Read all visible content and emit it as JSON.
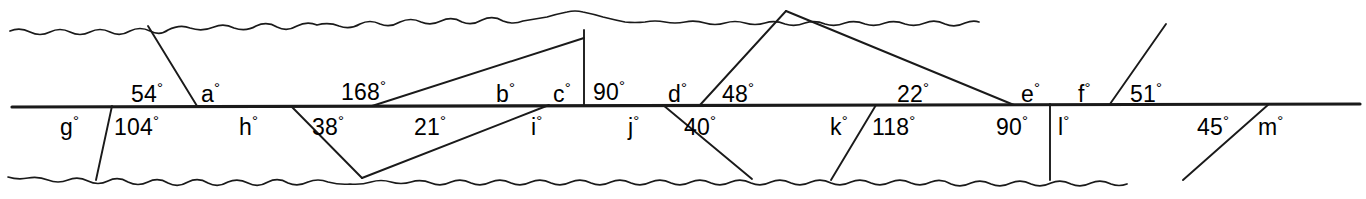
{
  "figure": {
    "type": "geometry-diagram",
    "line_color": "#1a1a1a",
    "background_color": "#ffffff"
  },
  "labels_above_line": [
    {
      "id": "a1",
      "text": "54",
      "x": 131,
      "y": 80
    },
    {
      "id": "a2",
      "text": "a",
      "x": 201,
      "y": 80
    },
    {
      "id": "a3",
      "text": "168",
      "x": 341,
      "y": 78
    },
    {
      "id": "a4",
      "text": "b",
      "x": 496,
      "y": 80
    },
    {
      "id": "a5",
      "text": "c",
      "x": 553,
      "y": 80
    },
    {
      "id": "a6",
      "text": "90",
      "x": 593,
      "y": 78
    },
    {
      "id": "a7",
      "text": "d",
      "x": 668,
      "y": 80
    },
    {
      "id": "a8",
      "text": "48",
      "x": 722,
      "y": 80
    },
    {
      "id": "a9",
      "text": "22",
      "x": 897,
      "y": 80
    },
    {
      "id": "a10",
      "text": "e",
      "x": 1021,
      "y": 80
    },
    {
      "id": "a11",
      "text": "f",
      "x": 1078,
      "y": 80
    },
    {
      "id": "a12",
      "text": "51",
      "x": 1130,
      "y": 80
    }
  ],
  "labels_below_line": [
    {
      "id": "b1",
      "text": "g",
      "x": 60,
      "y": 113
    },
    {
      "id": "b2",
      "text": "104",
      "x": 114,
      "y": 113
    },
    {
      "id": "b3",
      "text": "h",
      "x": 239,
      "y": 113
    },
    {
      "id": "b4",
      "text": "38",
      "x": 312,
      "y": 113
    },
    {
      "id": "b5",
      "text": "21",
      "x": 414,
      "y": 113
    },
    {
      "id": "b6",
      "text": "i",
      "x": 531,
      "y": 113
    },
    {
      "id": "b7",
      "text": "j",
      "x": 628,
      "y": 113
    },
    {
      "id": "b8",
      "text": "40",
      "x": 684,
      "y": 113
    },
    {
      "id": "b9",
      "text": "k",
      "x": 830,
      "y": 113
    },
    {
      "id": "b10",
      "text": "118",
      "x": 872,
      "y": 113
    },
    {
      "id": "b11",
      "text": "90",
      "x": 996,
      "y": 113
    },
    {
      "id": "b12",
      "text": "l",
      "x": 1058,
      "y": 113
    },
    {
      "id": "b13",
      "text": "45",
      "x": 1197,
      "y": 113
    },
    {
      "id": "b14",
      "text": "m",
      "x": 1258,
      "y": 113
    }
  ],
  "degree_symbol": "°",
  "geometry": {
    "main_line": {
      "x1": 12,
      "y1": 107,
      "x2": 1360,
      "y2": 104
    },
    "top_edge_y": 29,
    "bottom_edge_y": 179,
    "transversals": [
      {
        "name": "t-54-a-g-104-upper",
        "x1": 148,
        "y1": 26,
        "x2": 197,
        "y2": 106
      },
      {
        "name": "t-g-104-lower",
        "x1": 112,
        "y1": 106,
        "x2": 96,
        "y2": 180
      },
      {
        "name": "t-168-b",
        "x1": 372,
        "y1": 106,
        "x2": 584,
        "y2": 38
      },
      {
        "name": "t-vertical-c-90",
        "x1": 584,
        "y1": 30,
        "x2": 584,
        "y2": 106
      },
      {
        "name": "t-38-apex",
        "x1": 291,
        "y1": 106,
        "x2": 362,
        "y2": 178
      },
      {
        "name": "t-21-apex",
        "x1": 549,
        "y1": 105,
        "x2": 362,
        "y2": 178
      },
      {
        "name": "t-48-peak-left",
        "x1": 700,
        "y1": 105,
        "x2": 786,
        "y2": 11
      },
      {
        "name": "t-22-peak-right",
        "x1": 786,
        "y1": 11,
        "x2": 1014,
        "y2": 105
      },
      {
        "name": "t-40-lower",
        "x1": 663,
        "y1": 105,
        "x2": 752,
        "y2": 179
      },
      {
        "name": "t-k-118-lower",
        "x1": 876,
        "y1": 105,
        "x2": 831,
        "y2": 180
      },
      {
        "name": "t-vertical-90-l",
        "x1": 1050,
        "y1": 104,
        "x2": 1050,
        "y2": 180
      },
      {
        "name": "t-f-51",
        "x1": 1110,
        "y1": 104,
        "x2": 1166,
        "y2": 24
      },
      {
        "name": "t-45-m",
        "x1": 1183,
        "y1": 180,
        "x2": 1269,
        "y2": 104
      }
    ]
  }
}
